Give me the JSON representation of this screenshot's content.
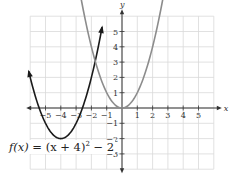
{
  "chart_data": {
    "type": "line",
    "title": "",
    "xlabel": "x",
    "ylabel": "y",
    "xlim": [
      -6,
      6
    ],
    "ylim": [
      -4,
      6
    ],
    "grid": true,
    "x_ticks": [
      -5,
      -4,
      -3,
      -2,
      -1,
      1,
      2,
      3,
      4,
      5
    ],
    "y_ticks": [
      -3,
      -2,
      -1,
      1,
      2,
      3,
      4,
      5
    ],
    "series": [
      {
        "name": "f(x) = (x + 4)^2 - 2",
        "color": "#1a1a1a",
        "formula": "(x+4)^2-2",
        "vertex": [
          -4,
          -2
        ],
        "x_range": [
          -6.1,
          -1.3
        ],
        "arrows": true
      },
      {
        "name": "y = x^2",
        "color": "#8c8c8c",
        "formula": "x^2",
        "vertex": [
          0,
          0
        ],
        "x_range": [
          -2.9,
          2.9
        ],
        "arrows": true
      }
    ],
    "annotations": [
      {
        "text": "f(x) = (x + 4)² − 2",
        "position": "lower-left"
      }
    ]
  },
  "equation": {
    "fx": "f(x)",
    "rest": " = (x + 4)",
    "exp": "2",
    "tail": " − 2"
  },
  "axes": {
    "x_label": "x",
    "y_label": "y"
  }
}
